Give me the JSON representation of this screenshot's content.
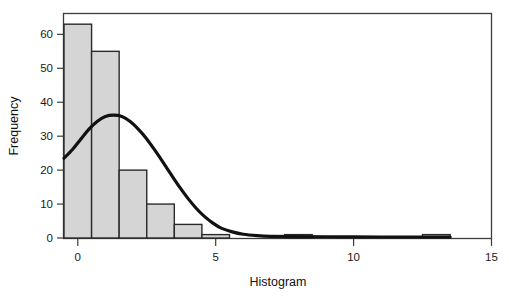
{
  "chart_data": {
    "type": "bar",
    "title": "",
    "xlabel": "Histogram",
    "ylabel": "Frequency",
    "xlim": [
      -0.5,
      15.0
    ],
    "ylim": [
      0,
      66
    ],
    "grid": false,
    "legend": null,
    "bin_width": 1,
    "categories": [
      "0",
      "1",
      "2",
      "3",
      "4",
      "5",
      "6",
      "7",
      "8",
      "9",
      "10",
      "11",
      "12",
      "13"
    ],
    "bin_edges": [
      -0.5,
      0.5,
      1.5,
      2.5,
      3.5,
      4.5,
      5.5,
      6.5,
      7.5,
      8.5,
      9.5,
      10.5,
      11.5,
      12.5,
      13.5
    ],
    "values": [
      63,
      55,
      20,
      10,
      4,
      1,
      0,
      0,
      1,
      0,
      0,
      0,
      0,
      1
    ],
    "x_ticks": [
      0,
      5,
      10,
      15
    ],
    "x_tick_labels": [
      "0",
      "5",
      "10",
      "15"
    ],
    "y_ticks": [
      0,
      10,
      20,
      30,
      40,
      50,
      60
    ],
    "y_tick_labels": [
      "0",
      "10",
      "20",
      "30",
      "40",
      "50",
      "60"
    ],
    "overlay": {
      "name": "normal-curve",
      "type": "line",
      "peak_x": 1.1,
      "peak_y": 36,
      "points": [
        [
          -0.5,
          23.5
        ],
        [
          -0.2,
          26.0
        ],
        [
          0.1,
          29.0
        ],
        [
          0.4,
          32.0
        ],
        [
          0.7,
          34.3
        ],
        [
          1.0,
          35.8
        ],
        [
          1.3,
          36.2
        ],
        [
          1.6,
          35.8
        ],
        [
          1.9,
          34.3
        ],
        [
          2.2,
          32.0
        ],
        [
          2.5,
          29.2
        ],
        [
          2.8,
          25.8
        ],
        [
          3.1,
          22.2
        ],
        [
          3.4,
          18.5
        ],
        [
          3.7,
          14.9
        ],
        [
          4.0,
          11.6
        ],
        [
          4.3,
          8.7
        ],
        [
          4.6,
          6.3
        ],
        [
          4.9,
          4.4
        ],
        [
          5.2,
          2.9
        ],
        [
          5.6,
          1.8
        ],
        [
          6.0,
          1.1
        ],
        [
          6.5,
          0.7
        ],
        [
          7.0,
          0.5
        ],
        [
          8.0,
          0.4
        ],
        [
          9.5,
          0.35
        ],
        [
          11.0,
          0.3
        ],
        [
          13.5,
          0.3
        ]
      ]
    },
    "colors": {
      "bar_fill": "#d5d5d5",
      "bar_stroke": "#2a2a2a",
      "curve": "#111111",
      "axis": "#3c3c3c",
      "text": "#1a1a1a",
      "background": "#ffffff"
    }
  }
}
